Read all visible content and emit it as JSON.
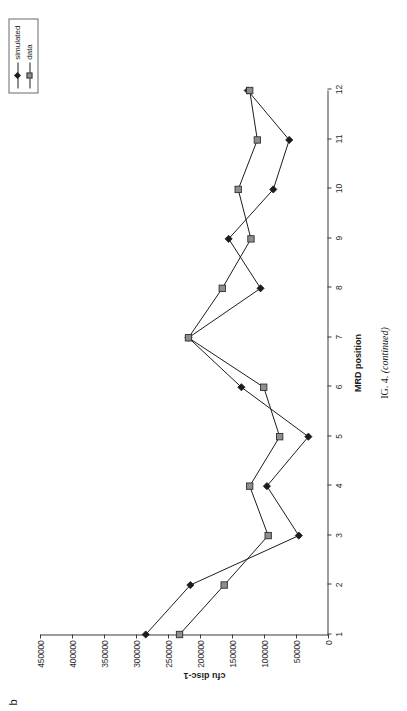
{
  "figure": {
    "panel_letter": "b",
    "caption_prefix": "F",
    "caption_main": "IG. 4.",
    "caption_continued": "(continued)",
    "caption_full": "FIG. 4. (continued)"
  },
  "legend": {
    "position": "top-right",
    "items": [
      {
        "label": "simulated",
        "marker": "diamond",
        "color": "#1c1c1c"
      },
      {
        "label": "data",
        "marker": "square",
        "color": "#8e8e8e"
      }
    ]
  },
  "chart_data": {
    "type": "line",
    "title": "",
    "xlabel": "MRD position",
    "ylabel": "cfu disc-1",
    "x": [
      1,
      2,
      3,
      4,
      5,
      6,
      7,
      8,
      9,
      10,
      11,
      12
    ],
    "categories": [
      "1",
      "2",
      "3",
      "4",
      "5",
      "6",
      "7",
      "8",
      "9",
      "10",
      "11",
      "12"
    ],
    "xlim": [
      1,
      12
    ],
    "ylim": [
      0,
      450000
    ],
    "y_ticks": [
      0,
      50000,
      100000,
      150000,
      200000,
      250000,
      300000,
      350000,
      400000,
      450000
    ],
    "y_tick_labels": [
      "0",
      "50000",
      "100000",
      "150000",
      "200000",
      "250000",
      "300000",
      "350000",
      "400000",
      "450000"
    ],
    "x_ticks": [
      1,
      2,
      3,
      4,
      5,
      6,
      7,
      8,
      9,
      10,
      11,
      12
    ],
    "grid": false,
    "legend_position": "top-right",
    "series": [
      {
        "name": "simulated",
        "marker": "diamond",
        "color": "#1c1c1c",
        "values": [
          285000,
          215000,
          45000,
          95000,
          30000,
          135000,
          218000,
          105000,
          155000,
          85000,
          60000,
          125000
        ]
      },
      {
        "name": "data",
        "marker": "square",
        "color": "#8e8e8e",
        "values": [
          232000,
          162000,
          93000,
          122000,
          75000,
          100000,
          218000,
          165000,
          120000,
          140000,
          110000,
          122000
        ]
      }
    ]
  }
}
